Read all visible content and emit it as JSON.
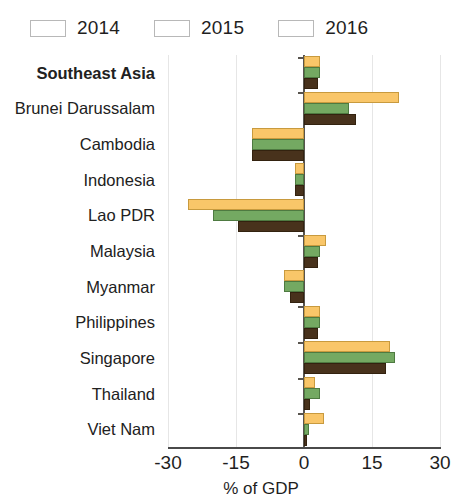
{
  "chart_data": {
    "type": "bar",
    "orientation": "horizontal",
    "title": "",
    "xlabel": "% of GDP",
    "ylabel": "",
    "xlim": [
      -30,
      30
    ],
    "xticks": [
      -30,
      -15,
      0,
      15,
      30
    ],
    "xtick_labels": [
      "-30",
      "-15",
      "0",
      "15",
      "30"
    ],
    "grid": true,
    "grid_axis": "x",
    "legend_position": "top-left",
    "categories": [
      "Southeast Asia",
      "Brunei Darussalam",
      "Cambodia",
      "Indonesia",
      "Lao PDR",
      "Malaysia",
      "Myanmar",
      "Philippines",
      "Singapore",
      "Thailand",
      "Viet Nam"
    ],
    "emphasized_categories": [
      "Southeast Asia"
    ],
    "series": [
      {
        "name": "2014",
        "color": "#f9c669",
        "values": [
          3.5,
          21.0,
          -11.5,
          -2.0,
          -25.5,
          4.8,
          -4.5,
          3.5,
          19.0,
          2.5,
          4.5
        ]
      },
      {
        "name": "2015",
        "color": "#74a962",
        "values": [
          3.5,
          10.0,
          -11.5,
          -2.0,
          -20.0,
          3.5,
          -4.5,
          3.5,
          20.0,
          3.5,
          1.0
        ]
      },
      {
        "name": "2016",
        "color": "#48321c",
        "values": [
          3.0,
          11.5,
          -11.5,
          -2.0,
          -14.5,
          3.0,
          -3.0,
          3.0,
          18.0,
          1.3,
          0.7
        ]
      }
    ]
  },
  "legend": {
    "items": [
      {
        "label": "2014",
        "color": "#f9c669"
      },
      {
        "label": "2015",
        "color": "#74a962"
      },
      {
        "label": "2016",
        "color": "#48321c"
      }
    ]
  },
  "axis": {
    "title": "% of GDP"
  }
}
